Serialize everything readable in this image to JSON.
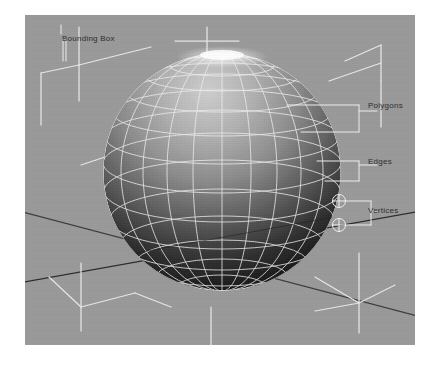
{
  "figure": {
    "kind": "3d-viewport-diagram",
    "background_color": "#ffffff",
    "viewport_color": "#9a9a9a"
  },
  "annotations": {
    "bounding_box": {
      "label": "Bounding Box"
    },
    "polygons": {
      "label": "Polygons"
    },
    "edges": {
      "label": "Edges"
    },
    "vertices": {
      "label": "Vertices"
    }
  },
  "colors": {
    "wireframe": "#f2f2f2",
    "bounding_box_line": "#e8e8e8",
    "ground_axis": "#2b2b2b",
    "leader_line": "#efefef",
    "label_text": "#2e2e2e",
    "sphere_light": "#b8b8b8",
    "sphere_dark": "#151515",
    "highlight": "#ffffff"
  },
  "sphere": {
    "center_x": 222,
    "center_y": 172,
    "radius": 119,
    "meridians": 20,
    "parallels": 14,
    "shading": "top-lit",
    "specular_highlight": "top-pole"
  },
  "vertex_markers": [
    {
      "x": 314,
      "y": 186
    },
    {
      "x": 314,
      "y": 210
    }
  ]
}
